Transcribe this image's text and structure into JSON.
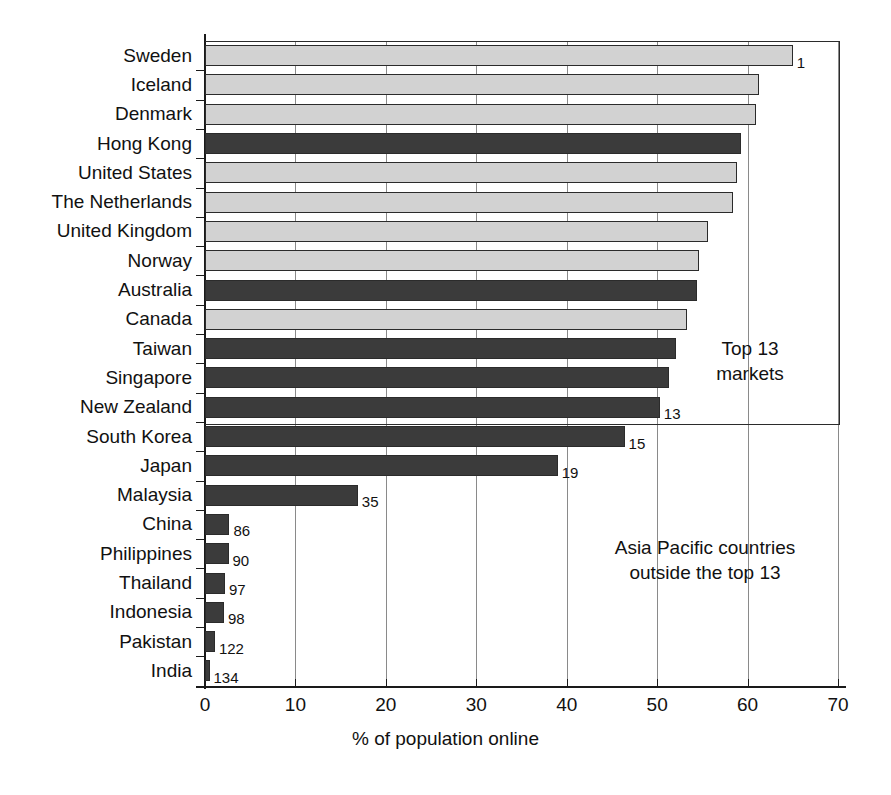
{
  "chart_data": {
    "type": "bar",
    "orientation": "horizontal",
    "title": "",
    "xlabel": "% of population online",
    "ylabel": "",
    "xlim": [
      0,
      70
    ],
    "xticks": [
      0,
      10,
      20,
      30,
      40,
      50,
      60,
      70
    ],
    "xtick_labels": [
      "0",
      "10",
      "20",
      "30",
      "40",
      "50",
      "60",
      "70"
    ],
    "grid": true,
    "grid_axis": "x",
    "legend": "none",
    "categories": [
      "Sweden",
      "Iceland",
      "Denmark",
      "Hong Kong",
      "United States",
      "The Netherlands",
      "United Kingdom",
      "Norway",
      "Australia",
      "Canada",
      "Taiwan",
      "Singapore",
      "New Zealand",
      "South Korea",
      "Japan",
      "Malaysia",
      "China",
      "Philippines",
      "Thailand",
      "Indonesia",
      "Pakistan",
      "India"
    ],
    "values": [
      65.0,
      61.3,
      60.9,
      59.3,
      58.8,
      58.4,
      55.6,
      54.6,
      54.4,
      53.3,
      52.1,
      51.3,
      50.3,
      46.4,
      39.0,
      16.9,
      2.7,
      2.6,
      2.2,
      2.1,
      1.1,
      0.5
    ],
    "point_labels": [
      "1",
      "",
      "",
      "",
      "",
      "",
      "",
      "",
      "",
      "",
      "",
      "",
      "13",
      "15",
      "19",
      "35",
      "86",
      "90",
      "97",
      "98",
      "122",
      "134"
    ],
    "bar_styles": [
      "light",
      "light",
      "light",
      "dark",
      "light",
      "light",
      "light",
      "light",
      "dark",
      "light",
      "dark",
      "dark",
      "dark",
      "dark",
      "dark",
      "dark",
      "dark",
      "dark",
      "dark",
      "dark",
      "dark",
      "dark"
    ],
    "series_key": {
      "light": "Top 13 markets (non Asia-Pacific)",
      "dark": "Asia Pacific countries"
    },
    "colors": {
      "light_bar": "#d2d2d2",
      "dark_bar": "#3b3b3b",
      "axis": "#1a1a1a",
      "grid": "#8a8a8a"
    },
    "annotations": [
      {
        "text": "Top 13\nmarkets"
      },
      {
        "text": "Asia Pacific countries\noutside the top 13"
      }
    ]
  }
}
